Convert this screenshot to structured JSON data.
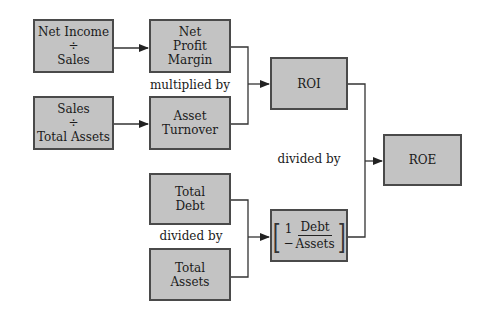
{
  "diagram": {
    "title": "",
    "nodes": {
      "net_income_sales": {
        "line1": "Net Income",
        "op": "÷",
        "line2": "Sales"
      },
      "net_profit_margin": {
        "line1": "Net",
        "line2": "Profit",
        "line3": "Margin"
      },
      "sales_total_assets": {
        "line1": "Sales",
        "op": "÷",
        "line2": "Total Assets"
      },
      "asset_turnover": {
        "line1": "Asset",
        "line2": "Turnover"
      },
      "roi": {
        "label": "ROI"
      },
      "roe": {
        "label": "ROE"
      },
      "total_debt": {
        "line1": "Total",
        "line2": "Debt"
      },
      "total_assets": {
        "line1": "Total",
        "line2": "Assets"
      },
      "equity_factor": {
        "left_bracket": "[",
        "one_minus": "1 −",
        "numerator": "Debt",
        "denominator": "Assets",
        "right_bracket": "]"
      }
    },
    "labels": {
      "multiplied_by": "multiplied by",
      "divided_by_roi": "divided by",
      "divided_by_debt": "divided by"
    },
    "edges": [
      {
        "from": "net_income_sales",
        "to": "net_profit_margin"
      },
      {
        "from": "sales_total_assets",
        "to": "asset_turnover"
      },
      {
        "from": [
          "net_profit_margin",
          "asset_turnover"
        ],
        "to": "roi"
      },
      {
        "from": [
          "total_debt",
          "total_assets"
        ],
        "to": "equity_factor"
      },
      {
        "from": [
          "roi",
          "equity_factor"
        ],
        "to": "roe"
      }
    ],
    "colors": {
      "box_fill": "#c3c3c3",
      "box_border": "#4a4a4a",
      "line": "#333333"
    }
  }
}
